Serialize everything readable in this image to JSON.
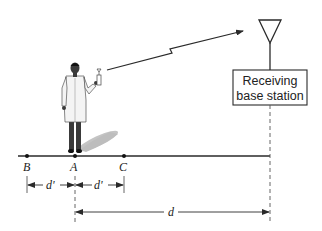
{
  "diagram": {
    "base_station": {
      "label_line1": "Receiving",
      "label_line2": "base station"
    },
    "points": [
      {
        "id": "B",
        "label": "B"
      },
      {
        "id": "A",
        "label": "A"
      },
      {
        "id": "C",
        "label": "C"
      }
    ],
    "dimensions": {
      "d_prime_left": "d'",
      "d_prime_right": "d'",
      "d": "d"
    },
    "colors": {
      "line": "#2a2a2a",
      "coat": "#f2f2f2",
      "skin": "#3a3a3a",
      "shadow": "#bdbdbd"
    }
  }
}
